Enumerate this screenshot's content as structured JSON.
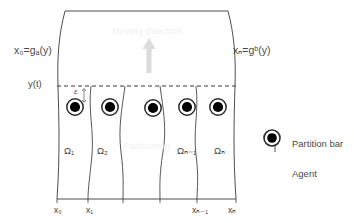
{
  "figure": {
    "type": "diagram",
    "boundaries": {
      "left_label": "x₀=gₐ(y)",
      "right_label": "xₙ=gᵇ(y)",
      "interface_label": "y(t)",
      "epsilon_label": "ε"
    },
    "moving_direction_label": "Moving direction",
    "watermark_lower_label": "Partitioning",
    "subdomains": [
      {
        "name": "omega-1",
        "label": "Ω₁"
      },
      {
        "name": "omega-2",
        "label": "Ω₂"
      },
      {
        "name": "omega-n-1",
        "label": "Ωₙ₋₁"
      },
      {
        "name": "omega-n",
        "label": "Ωₙ"
      }
    ],
    "x_ticks": [
      {
        "name": "x0",
        "label": "x₀"
      },
      {
        "name": "x1",
        "label": "x₁"
      },
      {
        "name": "xn-1",
        "label": "xₙ₋₁"
      },
      {
        "name": "xn",
        "label": "xₙ"
      }
    ],
    "legend": [
      {
        "marker": "partition-bar-icon",
        "label": "Partition bar"
      },
      {
        "marker": "agent-icon",
        "label": "Agent"
      }
    ],
    "agents": {
      "count": 5,
      "label": "Agent"
    },
    "colors": {
      "stroke": "#3a3a3a",
      "agent_fill": "#000000",
      "agent_ring": "#2b2b2b",
      "arrow": "#dcdcdc",
      "partition_bar": "#a9a9a9",
      "watermark": "#f0f0f0",
      "background": "#ffffff"
    }
  }
}
